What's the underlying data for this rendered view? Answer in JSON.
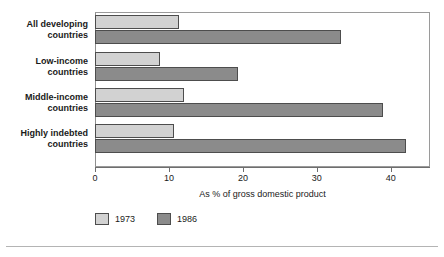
{
  "chart_data": {
    "type": "bar",
    "orientation": "horizontal",
    "title": "",
    "xlabel": "As % of gross domestic product",
    "ylabel": "",
    "xlim": [
      0,
      45.3
    ],
    "xticks": [
      0,
      10,
      20,
      30,
      40
    ],
    "xtick_labels": [
      "0",
      "10",
      "20",
      "30",
      "40"
    ],
    "grid": false,
    "legend_position": "bottom-left",
    "categories": [
      "All developing countries",
      "Low-income countries",
      "Middle-income countries",
      "Highly indebted countries"
    ],
    "category_lines": [
      [
        "All developing",
        "countries"
      ],
      [
        "Low-income",
        "countries"
      ],
      [
        "Middle-income",
        "countries"
      ],
      [
        "Highly indebted",
        "countries"
      ]
    ],
    "series": [
      {
        "name": "1973",
        "color": "#d2d2d2",
        "values": [
          11.3,
          8.8,
          12.0,
          10.7
        ]
      },
      {
        "name": "1986",
        "color": "#8b8b8b",
        "values": [
          33.2,
          19.4,
          38.9,
          42.0
        ]
      }
    ]
  },
  "colors": {
    "series_1973": "#d2d2d2",
    "series_1986": "#8b8b8b",
    "bar_outline": "#4d4d4d",
    "axis": "#6e6e6e",
    "frame": "#9a9a9a",
    "text": "#1a1a1a",
    "rule": "#b4b4b4",
    "background": "#ffffff"
  }
}
